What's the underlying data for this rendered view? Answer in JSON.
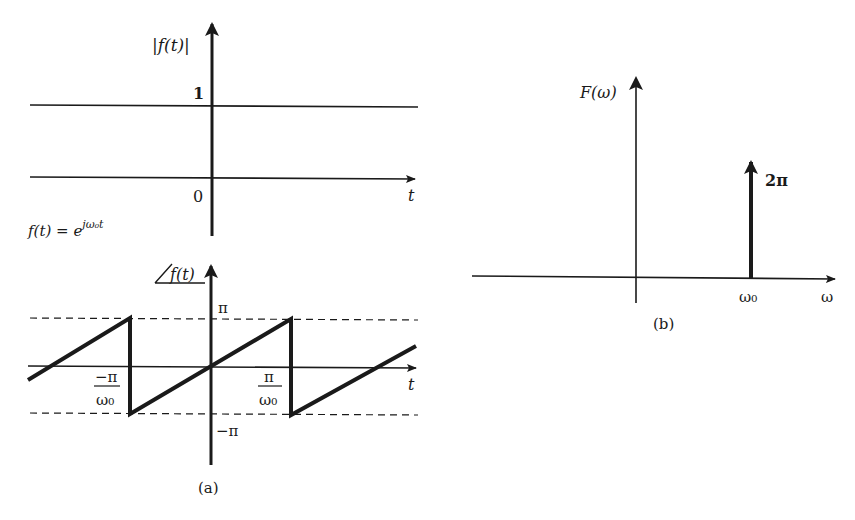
{
  "figure_a": {
    "caption": "(a)",
    "formula": "f(t) = e",
    "formula_exp": "jω₀t",
    "magnitude_plot": {
      "ylabel": "|f(t)|",
      "xlabel": "t",
      "level_label": "1",
      "origin_label": "0",
      "value": 1
    },
    "phase_plot": {
      "ylabel": "f(t)",
      "xlabel": "t",
      "upper_label": "π",
      "lower_label": "−π",
      "left_tick_num": "−π",
      "left_tick_den": "ω₀",
      "right_tick_num": "π",
      "right_tick_den": "ω₀"
    }
  },
  "figure_b": {
    "caption": "(b)",
    "ylabel": "F(ω)",
    "xlabel": "ω",
    "impulse_label": "2π",
    "impulse_position_label": "ω₀"
  },
  "colors": {
    "ink": "#1a1a1a",
    "background": "#ffffff"
  }
}
